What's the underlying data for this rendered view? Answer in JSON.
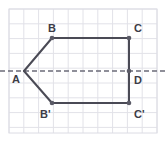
{
  "figure": {
    "colors": {
      "background": "#ffffff",
      "grid_line": "#e2e2e8",
      "grid_border": "#dcdce4",
      "shape_stroke": "#4a4a55",
      "vertex_dot": "#5a5a66",
      "dashed_axis": "#6b6b78",
      "label_text": "#3c3c46"
    },
    "grid": {
      "cell_size": 14.8,
      "x_start": 9,
      "x_end": 157,
      "y_start": 9,
      "y_end": 133,
      "columns": 10,
      "rows": 8.4
    },
    "axis": {
      "name": "line-of-symmetry",
      "style": "dashed",
      "y": 71,
      "x_start": 0,
      "x_end": 165,
      "dash_pattern": "5,3"
    },
    "vertices": [
      {
        "id": "A",
        "label": "A",
        "x": 24,
        "y": 71,
        "label_dx": -12,
        "label_dy": 3,
        "dot": false
      },
      {
        "id": "B",
        "label": "B",
        "x": 52,
        "y": 38,
        "label_dx": -4,
        "label_dy": -15,
        "dot": true
      },
      {
        "id": "C",
        "label": "C",
        "x": 129,
        "y": 38,
        "label_dx": 5,
        "label_dy": -15,
        "dot": true
      },
      {
        "id": "D",
        "label": "D",
        "x": 129,
        "y": 71,
        "label_dx": 5,
        "label_dy": 4,
        "dot": true
      },
      {
        "id": "Bp",
        "label": "B'",
        "x": 52,
        "y": 103,
        "label_dx": -12,
        "label_dy": 6,
        "dot": true
      },
      {
        "id": "Cp",
        "label": "C'",
        "x": 129,
        "y": 103,
        "label_dx": 5,
        "label_dy": 6,
        "dot": true
      }
    ],
    "edges": [
      {
        "name": "edge-A-B",
        "from": "A",
        "to": "B"
      },
      {
        "name": "edge-B-C",
        "from": "B",
        "to": "C"
      },
      {
        "name": "edge-C-D",
        "from": "C",
        "to": "D"
      },
      {
        "name": "edge-D-Cp",
        "from": "D",
        "to": "Cp"
      },
      {
        "name": "edge-Cp-Bp",
        "from": "Cp",
        "to": "Bp"
      },
      {
        "name": "edge-Bp-A",
        "from": "Bp",
        "to": "A"
      }
    ]
  }
}
